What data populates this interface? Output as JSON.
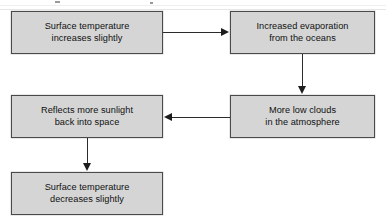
{
  "diagram": {
    "background_color": "#ffffff",
    "node_fill": "#d5d5d5",
    "node_border": "#4a4a4a",
    "connector_color": "#2b2b2b",
    "text_color": "#101010",
    "nodes": [
      {
        "id": "surface-temperature-increases",
        "text": "Surface temperature\nincreases slightly",
        "line1": "Surface temperature",
        "line2": "increases slightly"
      },
      {
        "id": "increased-evaporation",
        "text": "Increased evaporation\nfrom the oceans",
        "line1": "Increased evaporation",
        "line2": "from the oceans"
      },
      {
        "id": "more-low-clouds",
        "text": "More low clouds\nin the atmosphere",
        "line1": "More low clouds",
        "line2": "in the atmosphere"
      },
      {
        "id": "reflects-more-sunlight",
        "text": "Reflects more sunlight\nback into space",
        "line1": "Reflects more sunlight",
        "line2": "back into space"
      },
      {
        "id": "surface-temperature-decreases",
        "text": "Surface temperature\ndecreases slightly",
        "line1": "Surface temperature",
        "line2": "decreases slightly"
      }
    ],
    "connectors": [
      {
        "id": "temp-to-evaporation",
        "from": "surface-temperature-increases",
        "to": "increased-evaporation",
        "direction": "right"
      },
      {
        "id": "evaporation-to-clouds",
        "from": "increased-evaporation",
        "to": "more-low-clouds",
        "direction": "down"
      },
      {
        "id": "clouds-to-reflects",
        "from": "more-low-clouds",
        "to": "reflects-more-sunlight",
        "direction": "left"
      },
      {
        "id": "reflects-to-temp-decrease",
        "from": "reflects-more-sunlight",
        "to": "surface-temperature-decreases",
        "direction": "down"
      }
    ]
  }
}
